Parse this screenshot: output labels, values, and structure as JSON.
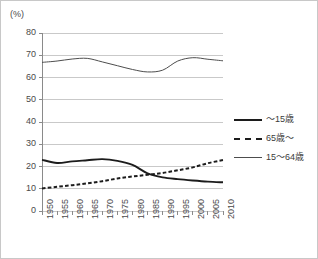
{
  "chart_data": {
    "type": "line",
    "title": "",
    "subtitle": "",
    "unit_label": "(%)",
    "xlabel": "",
    "ylabel": "",
    "ylim": [
      0,
      80
    ],
    "ytick_step": 10,
    "yticks": [
      "0",
      "10",
      "20",
      "30",
      "40",
      "50",
      "60",
      "70",
      "80"
    ],
    "grid": "horizontal",
    "legend_position": "right",
    "categories": [
      "1950",
      "1955",
      "1960",
      "1965",
      "1970",
      "1975",
      "1980",
      "1985",
      "1990",
      "1995",
      "2000",
      "2005",
      "2010"
    ],
    "series": [
      {
        "name": "〜15歳",
        "style": "solid-thick",
        "color": "#1c1c1c",
        "values": [
          23.0,
          21.6,
          22.3,
          22.8,
          23.3,
          22.5,
          20.7,
          16.9,
          15.1,
          14.3,
          13.7,
          13.2,
          12.9
        ]
      },
      {
        "name": "65歳〜",
        "style": "dashed",
        "color": "#1c1c1c",
        "values": [
          10.1,
          10.9,
          11.6,
          12.4,
          13.4,
          14.6,
          15.5,
          16.3,
          17.1,
          18.3,
          19.6,
          21.5,
          22.9
        ]
      },
      {
        "name": "15〜64歳",
        "style": "solid-thin",
        "color": "#4d4d4d",
        "values": [
          66.8,
          67.4,
          68.3,
          68.6,
          67.0,
          65.3,
          63.6,
          62.5,
          63.3,
          67.4,
          68.9,
          68.2,
          67.5
        ]
      }
    ],
    "legend": [
      {
        "label": "〜15歳",
        "style": "solid-thick"
      },
      {
        "label": "65歳〜",
        "style": "dashed"
      },
      {
        "label": "15〜64歳",
        "style": "solid-thin"
      }
    ],
    "colors": {
      "grid": "#c9c9c9",
      "axis": "#8a8a8a",
      "frame": "#c8c8c8",
      "text": "#3a3a3a"
    }
  }
}
